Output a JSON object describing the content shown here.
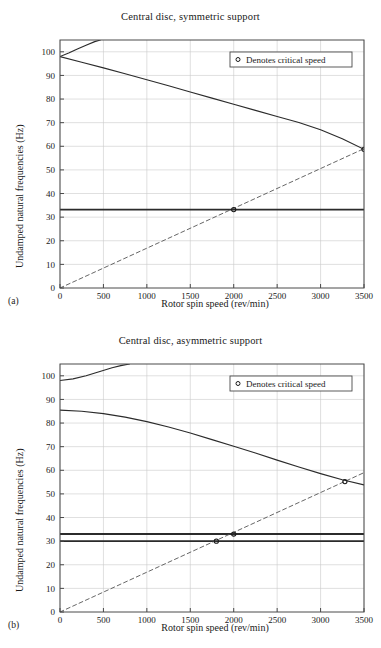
{
  "figure": {
    "panels": [
      {
        "panel_label": "(a)",
        "chart_data": {
          "type": "line",
          "title": "Central disc, symmetric support",
          "xlabel": "Rotor spin speed (rev/min)",
          "ylabel": "Undamped natural frequencies (Hz)",
          "xlim": [
            0,
            3500
          ],
          "ylim": [
            0,
            105
          ],
          "xticks": [
            0,
            500,
            1000,
            1500,
            2000,
            2500,
            3000,
            3500
          ],
          "yticks": [
            0,
            10,
            20,
            30,
            40,
            50,
            60,
            70,
            80,
            90,
            100
          ],
          "grid": true,
          "legend": {
            "position": "upper-right",
            "entries": [
              {
                "marker": "circle",
                "label": "Denotes critical speed"
              }
            ]
          },
          "series": [
            {
              "name": "Forward whirl (conical)",
              "style": "solid",
              "x": [
                0,
                100,
                200,
                300,
                400,
                465
              ],
              "values": [
                98.0,
                99.5,
                101.2,
                102.8,
                104.3,
                105.0
              ]
            },
            {
              "name": "Backward whirl (conical)",
              "style": "solid",
              "x": [
                0,
                250,
                500,
                750,
                1000,
                1250,
                1500,
                1750,
                2000,
                2250,
                2500,
                2750,
                3000,
                3250,
                3500
              ],
              "values": [
                98.0,
                95.6,
                93.2,
                90.7,
                88.2,
                85.6,
                83.0,
                80.4,
                77.8,
                75.2,
                72.6,
                70.1,
                67.0,
                63.2,
                58.7
              ]
            },
            {
              "name": "Cylindrical mode",
              "style": "solid-bold",
              "x": [
                0,
                3500
              ],
              "values": [
                33.2,
                33.2
              ]
            },
            {
              "name": "1x synchronous excitation",
              "style": "dashed",
              "x": [
                0,
                3500
              ],
              "values": [
                0,
                59.0
              ]
            }
          ],
          "critical_speeds": [
            {
              "x": 2000,
              "y": 33.2
            },
            {
              "x": 3500,
              "y": 58.7
            }
          ]
        }
      },
      {
        "panel_label": "(b)",
        "chart_data": {
          "type": "line",
          "title": "Central disc, asymmetric support",
          "xlabel": "Rotor spin speed (rev/min)",
          "ylabel": "Undamped natural frequencies (Hz)",
          "xlim": [
            0,
            3500
          ],
          "ylim": [
            0,
            105
          ],
          "xticks": [
            0,
            500,
            1000,
            1500,
            2000,
            2500,
            3000,
            3500
          ],
          "yticks": [
            0,
            10,
            20,
            30,
            40,
            50,
            60,
            70,
            80,
            90,
            100
          ],
          "grid": true,
          "legend": {
            "position": "upper-right",
            "entries": [
              {
                "marker": "circle",
                "label": "Denotes critical speed"
              }
            ]
          },
          "series": [
            {
              "name": "Forward whirl (conical)",
              "style": "solid",
              "x": [
                0,
                150,
                300,
                450,
                600,
                700,
                800
              ],
              "values": [
                98.0,
                98.7,
                100.0,
                101.7,
                103.4,
                104.3,
                105.0
              ]
            },
            {
              "name": "Backward whirl (conical)",
              "style": "solid",
              "x": [
                0,
                250,
                500,
                750,
                1000,
                1250,
                1500,
                1750,
                2000,
                2250,
                2500,
                2750,
                3000,
                3250,
                3500
              ],
              "values": [
                85.5,
                85.0,
                84.0,
                82.5,
                80.6,
                78.3,
                75.8,
                73.0,
                70.2,
                67.3,
                64.3,
                61.4,
                58.6,
                56.0,
                53.8
              ]
            },
            {
              "name": "Cylindrical mode 1",
              "style": "solid-bold",
              "x": [
                0,
                3500
              ],
              "values": [
                33.0,
                33.0
              ]
            },
            {
              "name": "Cylindrical mode 2",
              "style": "solid-bold",
              "x": [
                0,
                3500
              ],
              "values": [
                30.0,
                30.0
              ]
            },
            {
              "name": "1x synchronous excitation",
              "style": "dashed",
              "x": [
                0,
                3500
              ],
              "values": [
                0,
                59.0
              ]
            }
          ],
          "critical_speeds": [
            {
              "x": 1800,
              "y": 30.0
            },
            {
              "x": 2000,
              "y": 33.0
            },
            {
              "x": 3280,
              "y": 55.2
            }
          ]
        }
      }
    ]
  }
}
